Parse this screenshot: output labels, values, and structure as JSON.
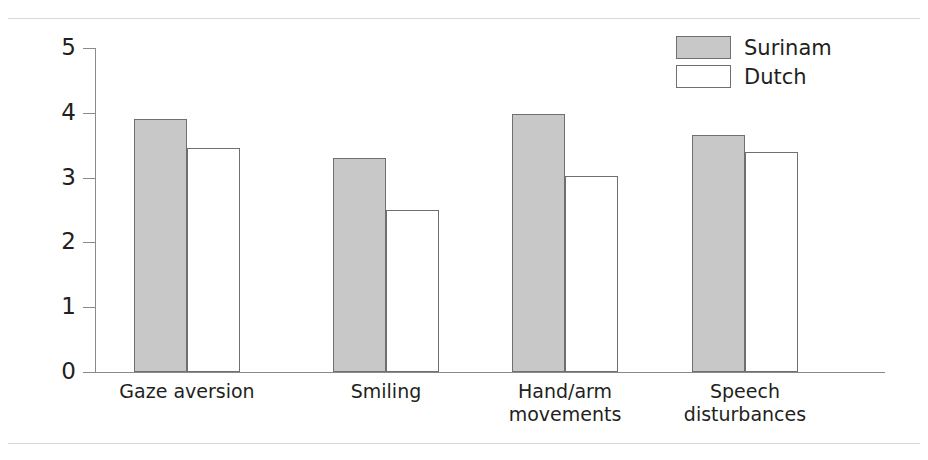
{
  "chart_data": {
    "type": "bar",
    "title": "",
    "xlabel": "",
    "ylabel": "",
    "ylim": [
      0,
      5
    ],
    "yticks": [
      0,
      1,
      2,
      3,
      4,
      5
    ],
    "ytick_labels": [
      "0",
      "1",
      "2",
      "3",
      "4",
      "5"
    ],
    "grid": false,
    "legend_position": "top-right",
    "categories": [
      "Gaze aversion",
      "Smiling",
      "Hand/arm\nmovements",
      "Speech\ndisturbances"
    ],
    "category_labels": [
      {
        "line1": "Gaze aversion",
        "line2": ""
      },
      {
        "line1": "Smiling",
        "line2": ""
      },
      {
        "line1": "Hand/arm",
        "line2": "movements"
      },
      {
        "line1": "Speech",
        "line2": "disturbances"
      }
    ],
    "series": [
      {
        "name": "Surinam",
        "color": "#c8c8c8",
        "values": [
          3.9,
          3.3,
          3.98,
          3.65
        ]
      },
      {
        "name": "Dutch",
        "color": "#ffffff",
        "values": [
          3.45,
          2.5,
          3.02,
          3.4
        ]
      }
    ]
  },
  "legend": {
    "entries": [
      {
        "label": "Surinam",
        "swatch": "surinam"
      },
      {
        "label": "Dutch",
        "swatch": "dutch"
      }
    ]
  },
  "colors": {
    "bar_fill_surinam": "#c8c8c8",
    "bar_fill_dutch": "#ffffff",
    "bar_stroke": "#6f6f6f",
    "axis": "#8a8a8a",
    "text": "#231f20",
    "rule": "#d8d8d8"
  }
}
